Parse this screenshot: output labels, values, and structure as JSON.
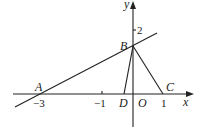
{
  "diagram": {
    "type": "coordinate-geometry",
    "axes": {
      "x_label": "x",
      "y_label": "y",
      "origin_label": "O"
    },
    "ticks": {
      "x": [
        {
          "value": -3,
          "label": "−3"
        },
        {
          "value": -1,
          "label": "−1"
        },
        {
          "value": 1,
          "label": "1"
        }
      ],
      "y": [
        {
          "value": 2,
          "label": "2"
        }
      ]
    },
    "points": [
      {
        "name": "A",
        "coords": [
          -3,
          0
        ]
      },
      {
        "name": "B",
        "coords": [
          0,
          1.5
        ]
      },
      {
        "name": "C",
        "coords": [
          1,
          0
        ]
      },
      {
        "name": "D",
        "coords": [
          -0.3,
          0
        ]
      }
    ],
    "segments": [
      [
        "A",
        "B",
        "extended line"
      ],
      [
        "B",
        "D"
      ],
      [
        "B",
        "C"
      ]
    ]
  },
  "labels": {
    "A": "A",
    "B": "B",
    "C": "C",
    "D": "D",
    "O": "O",
    "x": "x",
    "y": "y",
    "tick_m3": "−3",
    "tick_m1": "−1",
    "tick_1": "1",
    "tick_2": "2"
  }
}
